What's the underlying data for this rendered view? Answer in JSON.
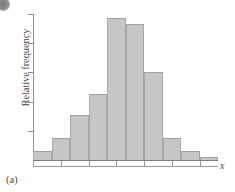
{
  "figure": {
    "panel_label": "(a)",
    "xlabel": "x",
    "ylabel": "Relative frequency",
    "artifact_icon": "ink-blob-icon",
    "bar_fill_color": "#c6c6c6",
    "bar_edge_color": "#a7a7a7",
    "axis_color": "#8f8f8f"
  },
  "chart_data": {
    "type": "bar",
    "title": "",
    "subtitle": "",
    "xlabel": "x",
    "ylabel": "Relative frequency",
    "legend": [],
    "grid": false,
    "categories": [
      "1",
      "2",
      "3",
      "4",
      "5",
      "6",
      "7",
      "8",
      "9",
      "10"
    ],
    "values": [
      0.006,
      0.015,
      0.031,
      0.045,
      0.097,
      0.093,
      0.06,
      0.015,
      0.006,
      0.002
    ],
    "ylim": [
      0,
      0.1
    ],
    "xlim": [
      0,
      10
    ],
    "x_tick_labels": [
      "",
      "",
      "",
      "",
      "",
      "",
      ""
    ],
    "y_tick_labels": [
      "",
      "",
      "",
      "",
      ""
    ],
    "y_tick_values": [
      0.02,
      0.04,
      0.06,
      0.08,
      0.1
    ],
    "n_bars": 10,
    "shape": "unimodal approximately symmetric bell-shaped"
  }
}
